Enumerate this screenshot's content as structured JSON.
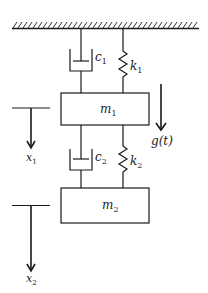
{
  "diagram": {
    "colors": {
      "stroke": "#1a1a1a",
      "background": "#ffffff"
    },
    "ground": {
      "label": "fixed support"
    },
    "masses": [
      {
        "id": "m1",
        "base": "m",
        "sub": "1"
      },
      {
        "id": "m2",
        "base": "m",
        "sub": "2"
      }
    ],
    "dampers": [
      {
        "id": "c1",
        "base": "c",
        "sub": "1"
      },
      {
        "id": "c2",
        "base": "c",
        "sub": "2"
      }
    ],
    "springs": [
      {
        "id": "k1",
        "base": "k",
        "sub": "1"
      },
      {
        "id": "k2",
        "base": "k",
        "sub": "2"
      }
    ],
    "displacements": [
      {
        "id": "x1",
        "base": "x",
        "sub": "1"
      },
      {
        "id": "x2",
        "base": "x",
        "sub": "2"
      }
    ],
    "force": {
      "label": "g(t)"
    }
  }
}
